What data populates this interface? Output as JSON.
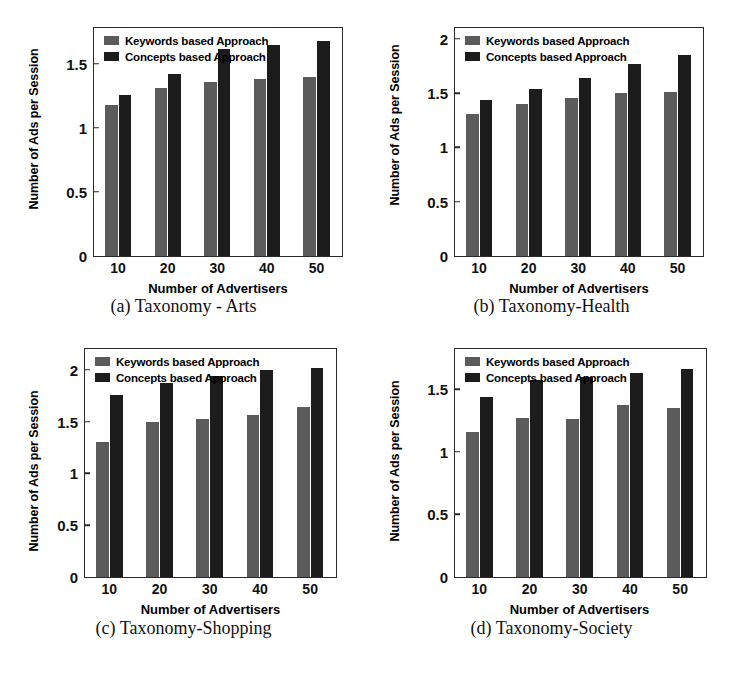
{
  "figure": {
    "legend_labels": [
      "Keywords based Approach",
      "Concepts based Approach"
    ],
    "series_colors": {
      "keywords": "#5b5b5b",
      "concepts": "#1c1c1c"
    },
    "xlabel": "Number of Advertisers",
    "ylabel": "Number of Ads per Session"
  },
  "panels": [
    {
      "id": "a",
      "caption": "(a) Taxonomy - Arts",
      "chart_data": {
        "type": "bar",
        "title": "",
        "xlabel": "Number of Advertisers",
        "ylabel": "Number of Ads per Session",
        "categories": [
          "10",
          "20",
          "30",
          "40",
          "50"
        ],
        "yticks": [
          "0",
          "0.5",
          "1",
          "1.5"
        ],
        "ytick_values": [
          0,
          0.5,
          1,
          1.5
        ],
        "ylim": [
          0,
          1.78
        ],
        "grid": false,
        "legend_position": "top-left",
        "series": [
          {
            "name": "Keywords based Approach",
            "values": [
              1.18,
              1.31,
              1.36,
              1.38,
              1.4
            ]
          },
          {
            "name": "Concepts based Approach",
            "values": [
              1.26,
              1.42,
              1.62,
              1.65,
              1.68
            ]
          }
        ]
      }
    },
    {
      "id": "b",
      "caption": "(b) Taxonomy-Health",
      "chart_data": {
        "type": "bar",
        "title": "",
        "xlabel": "Number of Advertisers",
        "ylabel": "Number of Ads per Session",
        "categories": [
          "10",
          "20",
          "30",
          "40",
          "50"
        ],
        "yticks": [
          "0",
          "0.5",
          "1",
          "1.5",
          "2"
        ],
        "ytick_values": [
          0,
          0.5,
          1,
          1.5,
          2
        ],
        "ylim": [
          0,
          2.1
        ],
        "grid": false,
        "legend_position": "top-left",
        "series": [
          {
            "name": "Keywords based Approach",
            "values": [
              1.31,
              1.4,
              1.46,
              1.5,
              1.51
            ]
          },
          {
            "name": "Concepts based Approach",
            "values": [
              1.44,
              1.54,
              1.64,
              1.77,
              1.85
            ]
          }
        ]
      }
    },
    {
      "id": "c",
      "caption": "(c) Taxonomy-Shopping",
      "chart_data": {
        "type": "bar",
        "title": "",
        "xlabel": "Number of Advertisers",
        "ylabel": "Number of Ads per Session",
        "categories": [
          "10",
          "20",
          "30",
          "40",
          "50"
        ],
        "yticks": [
          "0",
          "0.5",
          "1",
          "1.5",
          "2"
        ],
        "ytick_values": [
          0,
          0.5,
          1,
          1.5,
          2
        ],
        "ylim": [
          0,
          2.2
        ],
        "grid": false,
        "legend_position": "top-left",
        "series": [
          {
            "name": "Keywords based Approach",
            "values": [
              1.3,
              1.5,
              1.52,
              1.56,
              1.64
            ]
          },
          {
            "name": "Concepts based Approach",
            "values": [
              1.76,
              1.87,
              1.94,
              2.0,
              2.02
            ]
          }
        ]
      }
    },
    {
      "id": "d",
      "caption": "(d) Taxonomy-Society",
      "chart_data": {
        "type": "bar",
        "title": "",
        "xlabel": "Number of Advertisers",
        "ylabel": "Number of Ads per Session",
        "categories": [
          "10",
          "20",
          "30",
          "40",
          "50"
        ],
        "yticks": [
          "0",
          "0.5",
          "1",
          "1.5"
        ],
        "ytick_values": [
          0,
          0.5,
          1,
          1.5
        ],
        "ylim": [
          0,
          1.82
        ],
        "grid": false,
        "legend_position": "top-left",
        "series": [
          {
            "name": "Keywords based Approach",
            "values": [
              1.16,
              1.27,
              1.26,
              1.37,
              1.35
            ]
          },
          {
            "name": "Concepts based Approach",
            "values": [
              1.44,
              1.57,
              1.6,
              1.63,
              1.66
            ]
          }
        ]
      }
    }
  ]
}
